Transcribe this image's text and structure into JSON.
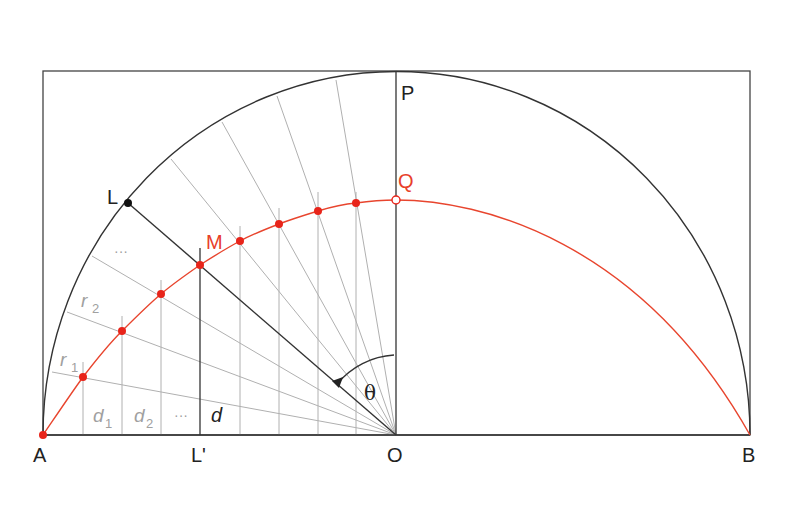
{
  "diagram": {
    "labels": {
      "A": "A",
      "B": "B",
      "O": "O",
      "P": "P",
      "Q": "Q",
      "L": "L",
      "L_prime": "L'",
      "M": "M",
      "theta": "θ",
      "r1": "r",
      "r1_sub": "1",
      "r2": "r",
      "r2_sub": "2",
      "d1": "d",
      "d1_sub": "1",
      "d2": "d",
      "d2_sub": "2",
      "d": "d",
      "ellipsis": "···"
    },
    "colors": {
      "frame": "#333333",
      "arc": "#333333",
      "curve": "#e8402a",
      "points": "#e8241a",
      "rays": "#aaaaaa",
      "grey_text": "#a0a0a0"
    },
    "points": {
      "A": [
        43,
        435
      ],
      "B": [
        750,
        435
      ],
      "O": [
        396,
        435
      ],
      "P": [
        396,
        72
      ],
      "Q": [
        396,
        200
      ],
      "L": [
        128,
        203
      ],
      "M": [
        200,
        265
      ],
      "L_prime": [
        200,
        435
      ]
    },
    "red_points": [
      [
        83,
        377
      ],
      [
        122,
        331
      ],
      [
        161,
        294
      ],
      [
        200,
        265
      ],
      [
        240,
        241
      ],
      [
        279,
        224
      ],
      [
        318,
        211
      ],
      [
        356,
        203
      ]
    ],
    "ray_ends": [
      [
        52,
        372
      ],
      [
        67,
        312
      ],
      [
        92,
        256
      ],
      [
        171,
        159
      ],
      [
        222,
        122
      ],
      [
        277,
        96
      ],
      [
        336,
        80
      ]
    ]
  }
}
